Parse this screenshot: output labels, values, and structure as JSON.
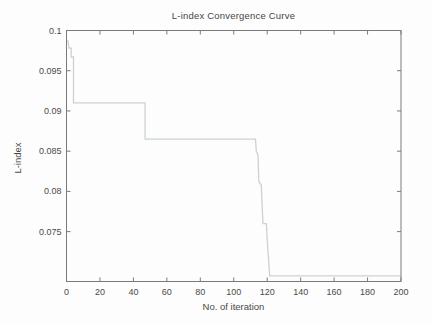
{
  "chart_data": {
    "type": "line",
    "title": "L-index Convergence Curve",
    "xlabel": "No. of iteration",
    "ylabel": "L-index",
    "xlim": [
      0,
      200
    ],
    "ylim": [
      0.0688,
      0.1
    ],
    "xticks": [
      0,
      20,
      40,
      60,
      80,
      100,
      120,
      140,
      160,
      180,
      200
    ],
    "xtick_labels": [
      "0",
      "20",
      "40",
      "60",
      "80",
      "100",
      "120",
      "140",
      "160",
      "180",
      "200"
    ],
    "yticks": [
      0.075,
      0.08,
      0.085,
      0.09,
      0.095,
      0.1
    ],
    "ytick_labels": [
      "0.075",
      "0.08",
      "0.085",
      "0.09",
      "0.095",
      "0.1"
    ],
    "grid": false,
    "legend": null,
    "colors": {
      "line": "#ccd3cc",
      "axis": "#7a7a7a",
      "text": "#4a4a4a",
      "background": "#fdfdfd"
    },
    "series": [
      {
        "name": "L-index",
        "points": [
          [
            0.8,
            0.0988
          ],
          [
            1.5,
            0.0978
          ],
          [
            2.8,
            0.0978
          ],
          [
            2.8,
            0.0967
          ],
          [
            4.2,
            0.0967
          ],
          [
            4.2,
            0.091
          ],
          [
            47,
            0.091
          ],
          [
            47,
            0.0865
          ],
          [
            113,
            0.0865
          ],
          [
            113.5,
            0.085
          ],
          [
            114.5,
            0.0845
          ],
          [
            115,
            0.0812
          ],
          [
            116.5,
            0.0808
          ],
          [
            117,
            0.078
          ],
          [
            117.5,
            0.076
          ],
          [
            119.5,
            0.076
          ],
          [
            120,
            0.074
          ],
          [
            121.5,
            0.0695
          ],
          [
            200,
            0.0695
          ]
        ]
      }
    ]
  }
}
